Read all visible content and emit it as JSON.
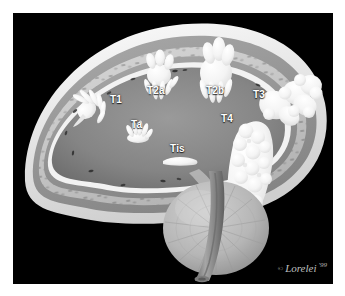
{
  "figure": {
    "background_color": "#ffffff",
    "canvas_color": "#000000",
    "label_color": "#ffffff"
  },
  "palette": {
    "lumen": "#8a8a8a",
    "lumen_dark": "#6f6f6f",
    "muscle_layer": "#9b9b9b",
    "submucosa_layer": "#c9c9c9",
    "serosa_layer": "#ededed",
    "mucosa_line": "#f2f2f2",
    "tumor": "#fbfbfb",
    "prostate": "#b9b9b9",
    "urethra": "#8f8f8f",
    "nuclei": "#2a2a2a"
  },
  "labels": [
    {
      "id": "t1",
      "text": "T1",
      "x": 97,
      "y": 82,
      "stage": "T1"
    },
    {
      "id": "t2a",
      "text": "T2a",
      "x": 134,
      "y": 73,
      "stage": "T2a"
    },
    {
      "id": "t2b",
      "text": "T2b",
      "x": 193,
      "y": 73,
      "stage": "T2b"
    },
    {
      "id": "t3",
      "text": "T3",
      "x": 240,
      "y": 77,
      "stage": "T3"
    },
    {
      "id": "t4",
      "text": "T4",
      "x": 208,
      "y": 101,
      "stage": "T4"
    },
    {
      "id": "ta",
      "text": "Ta",
      "x": 118,
      "y": 107,
      "stage": "Ta"
    },
    {
      "id": "tis",
      "text": "Tis",
      "x": 157,
      "y": 131,
      "stage": "Tis"
    }
  ],
  "signature": {
    "copyright_mark": "©",
    "artist": "Lorelei",
    "year": "'99"
  },
  "anatomy": {
    "organ": "urinary bladder",
    "layers": [
      "serosa",
      "muscularis propria",
      "lamina propria / submucosa",
      "urothelium (mucosa)",
      "lumen"
    ],
    "structures": [
      "prostate",
      "prostatic urethra"
    ]
  }
}
